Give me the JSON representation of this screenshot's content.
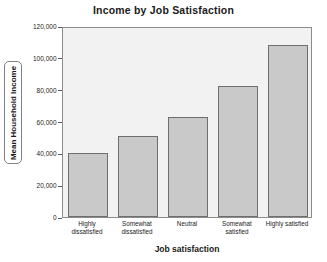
{
  "chart_data": {
    "type": "bar",
    "title": "Income by Job Satisfaction",
    "xlabel": "Job satisfaction",
    "ylabel": "Mean Household Income",
    "categories": [
      "Highly dissatisfied",
      "Somewhat dissatisfied",
      "Neutral",
      "Somewhat satisfied",
      "Highly satisfied"
    ],
    "values": [
      40000,
      51000,
      63000,
      82000,
      108000
    ],
    "ylim": [
      0,
      120000
    ],
    "ytick_values": [
      0,
      20000,
      40000,
      60000,
      80000,
      100000,
      120000
    ],
    "ytick_labels": [
      "0",
      "20,000",
      "40,000",
      "60,000",
      "80,000",
      "100,000",
      "120,000"
    ],
    "grid": false,
    "legend": null,
    "colors": {
      "bar_fill": "#c9c9c9",
      "bar_border": "#6e6e6e",
      "plot_background": "#f2f2f2",
      "frame": "#8c8c8c",
      "text": "#1a1a1a"
    }
  }
}
